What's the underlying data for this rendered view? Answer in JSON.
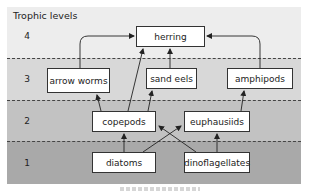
{
  "title": "Trophic levels",
  "levels": [
    {
      "number": "4",
      "color": "#ededed"
    },
    {
      "number": "3",
      "color": "#d8d8d8"
    },
    {
      "number": "2",
      "color": "#c2c2c2"
    },
    {
      "number": "1",
      "color": "#a9a9a9"
    }
  ],
  "nodes": {
    "herring": "herring",
    "arrow_worms": "arrow worms",
    "sand_eels": "sand eels",
    "amphipods": "amphipods",
    "copepods": "copepods",
    "euphausiids": "euphausiids",
    "diatoms": "diatoms",
    "dinoflagellates": "dinoflagellates"
  },
  "edges": [
    {
      "from": "arrow worms",
      "to": "herring"
    },
    {
      "from": "sand eels",
      "to": "herring"
    },
    {
      "from": "copepods",
      "to": "herring"
    },
    {
      "from": "amphipods",
      "to": "herring"
    },
    {
      "from": "copepods",
      "to": "arrow worms"
    },
    {
      "from": "copepods",
      "to": "sand eels"
    },
    {
      "from": "euphausiids",
      "to": "amphipods"
    },
    {
      "from": "diatoms",
      "to": "copepods"
    },
    {
      "from": "diatoms",
      "to": "euphausiids"
    },
    {
      "from": "dinoflagellates",
      "to": "copepods"
    },
    {
      "from": "dinoflagellates",
      "to": "euphausiids"
    }
  ]
}
